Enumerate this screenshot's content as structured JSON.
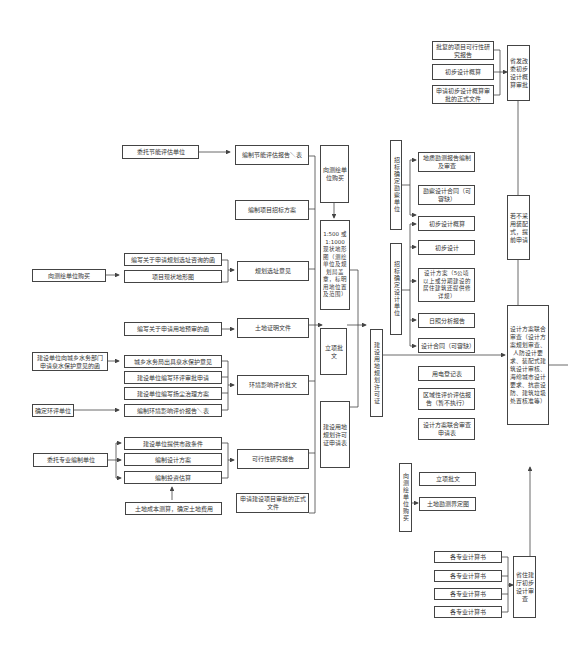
{
  "diagram": {
    "type": "process-flowchart",
    "nodes": {
      "feasibility_approval": "批复的项目可行性研究报告",
      "prelim_estimate_top": "初步设计概算",
      "prelim_estimate_doc": "申请初步设计概算审批的正式文件",
      "ndrc_review": "省发改委初步设计概算审批",
      "no_prefab": "若不采用装配式，提前申请",
      "entrust_energy": "委托节能评估单位",
      "energy_report": "编制节能评估报告＼表",
      "bid_plan": "编制项目招标方案",
      "buy_survey_left": "向测绘单位购买",
      "site_letter": "编写关于申请规划选址咨询的函",
      "site_map": "项目现状地形图",
      "site_opinion": "规划选址意见",
      "land_letter": "编写关于申请用地预审的函",
      "land_doc": "土地证明文件",
      "water_letter": "建设单位向城乡水务部门申请泉水保护意见的函",
      "water_opinion": "城乡水务局出具泉水保护意见",
      "eia_apply": "建设单位编写环评审批申请",
      "dust_plan": "建设单位编写扬尘治理方案",
      "eia_unit": "确定环评单位",
      "eia_report": "编制环境影响评价报告＼表",
      "eia_approval": "环境影响评价批文",
      "entrust_design": "委托专业编制单位",
      "municipal": "建设单位提供市政条件",
      "design_scheme": "编制设计方案",
      "investment_est": "编制投资估算",
      "land_cost": "土地成本测算，确定土地费用",
      "feasibility": "可行性研究报告",
      "project_approval_doc": "申请建设项目审批的正式文件",
      "buy_survey_mid": "向测绘单位购买",
      "topo_map": "1:500 或 1:1000 现状地形图（测绘单位及规划局盖章，标明用地位置及范围）",
      "project_approval": "立项批文",
      "land_permit_apply": "建设用地规划许可证申请表",
      "land_permit": "建设用地规划许可证",
      "bid_survey_unit": "招标确定勘察单位",
      "geo_report": "地质勘测报告编制及审查",
      "survey_contract": "勘察设计合同（可容缺）",
      "bid_design_unit": "招标确定设计单位",
      "prelim_estimate_mid": "初步设计概算",
      "prelim_design": "初步设计",
      "design_plan": "设计方案（5公顷以上或分期建设的居住建筑还提供修详规）",
      "sunlight": "日照分析报告",
      "design_contract": "设计合同（可容缺）",
      "power_reg": "用电登记表",
      "regional_eval": "区域性评价评估报告（暂不执行）",
      "joint_review_form": "设计方案联合审查申请表",
      "buy_survey_bottom": "向测绘单位购买",
      "project_approval_bottom": "立项批文",
      "boundary_map": "土地勘测界定图",
      "joint_review": "设计方案联合审查（设计方案规划审查、人防设计要求、装配式建筑设计审核、海绵城市设计要求、抗震设防、建筑垃圾处置核准等）",
      "calc_1": "各专业计算书",
      "calc_2": "各专业计算书",
      "calc_3": "各专业计算书",
      "calc_4": "各专业计算书",
      "provincial_review": "省住建厅初步设计审查"
    },
    "colors": {
      "line": "#444444",
      "box_border": "#444444",
      "text": "#333333",
      "background": "#ffffff"
    }
  }
}
